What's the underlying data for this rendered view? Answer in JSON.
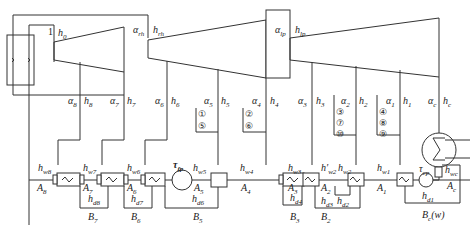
{
  "diagram": {
    "boiler": {
      "label": "boiler"
    },
    "stage_inlet": {
      "number": "1",
      "enthalpy": "h0"
    },
    "turbine_labels": [
      {
        "id": "rh",
        "alpha": "α",
        "alpha_sub": "rh",
        "h": "h",
        "h_sub": "rh"
      },
      {
        "id": "lp",
        "alpha": "α",
        "alpha_sub": "lp",
        "h": "h",
        "h_sub": "lp"
      }
    ],
    "extractions": [
      {
        "alpha": "α",
        "alpha_sub": "8",
        "h": "h",
        "h_sub": "8"
      },
      {
        "alpha": "α",
        "alpha_sub": "7",
        "h": "h",
        "h_sub": "7"
      },
      {
        "alpha": "α",
        "alpha_sub": "6",
        "h": "h",
        "h_sub": "6"
      },
      {
        "alpha": "α",
        "alpha_sub": "5",
        "h": "h",
        "h_sub": "5"
      },
      {
        "alpha": "α",
        "alpha_sub": "4",
        "h": "h",
        "h_sub": "4"
      },
      {
        "alpha": "α",
        "alpha_sub": "3",
        "h": "h",
        "h_sub": "3"
      },
      {
        "alpha": "α",
        "alpha_sub": "2",
        "h": "h",
        "h_sub": "2"
      },
      {
        "alpha": "α",
        "alpha_sub": "1",
        "h": "h",
        "h_sub": "1"
      },
      {
        "alpha": "α",
        "alpha_sub": "c",
        "h": "h",
        "h_sub": "c"
      }
    ],
    "circled_groups": [
      [
        "①",
        "⑤"
      ],
      [
        "②",
        "⑥"
      ],
      [
        "③",
        "⑦",
        "⑩"
      ],
      [
        "④",
        "⑧",
        "⑨"
      ]
    ],
    "feedwater_labels": [
      {
        "h": "h",
        "sub": "w8"
      },
      {
        "h": "h",
        "sub": "w7"
      },
      {
        "h": "h",
        "sub": "w6"
      },
      {
        "h": "h",
        "sub": "w5"
      },
      {
        "h": "h",
        "sub": "w4"
      },
      {
        "h": "h",
        "sub": "w3"
      },
      {
        "h": "h′",
        "sub": "w2"
      },
      {
        "h": "h",
        "sub": "w2"
      },
      {
        "h": "h",
        "sub": "w1"
      },
      {
        "h": "h",
        "sub": "wc"
      }
    ],
    "drain_labels": [
      {
        "h": "h",
        "sub": "d8"
      },
      {
        "h": "h",
        "sub": "d7"
      },
      {
        "h": "h",
        "sub": "d6"
      },
      {
        "h": "h",
        "sub": "d4"
      },
      {
        "h": "h",
        "sub": "d3"
      },
      {
        "h": "h",
        "sub": "d2"
      },
      {
        "h": "h",
        "sub": "d1"
      }
    ],
    "heater_labels": [
      {
        "a": "A",
        "sub": "8"
      },
      {
        "a": "A",
        "sub": "7"
      },
      {
        "a": "A",
        "sub": "6"
      },
      {
        "a": "A",
        "sub": "5"
      },
      {
        "a": "A",
        "sub": "4"
      },
      {
        "a": "A",
        "sub": "3"
      },
      {
        "a": "A",
        "sub": "2"
      },
      {
        "a": "A",
        "sub": "1"
      },
      {
        "a": "A",
        "sub": "c"
      }
    ],
    "drain_group_labels": [
      {
        "b": "B",
        "sub": "7"
      },
      {
        "b": "B",
        "sub": "6"
      },
      {
        "b": "B",
        "sub": "5"
      },
      {
        "b": "B",
        "sub": "3"
      },
      {
        "b": "B",
        "sub": "2"
      },
      {
        "b": "B",
        "sub": "c",
        "suffix": "(w)"
      }
    ],
    "pumps": [
      {
        "t": "τ",
        "sub": "fp"
      },
      {
        "t": "τ",
        "sub": "cp"
      }
    ],
    "line_color": "#333333"
  }
}
